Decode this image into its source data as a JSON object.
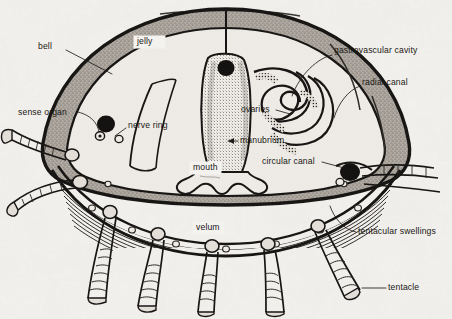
{
  "diagram": {
    "background_color": "#f4f2ee",
    "ink_color": "#15130f",
    "jelly_fill": "#a9a39b",
    "labels": [
      {
        "id": "bell",
        "text": "bell",
        "x": 38,
        "y": 47,
        "anchor": "start",
        "boxed": false
      },
      {
        "id": "jelly",
        "text": "jelly",
        "x": 137,
        "y": 42,
        "anchor": "start",
        "boxed": true
      },
      {
        "id": "gastrovascular-cavity",
        "text": "gastrovascular cavity",
        "x": 334,
        "y": 51,
        "anchor": "start",
        "boxed": false
      },
      {
        "id": "radial-canal",
        "text": "radial canal",
        "x": 362,
        "y": 83,
        "anchor": "start",
        "boxed": false
      },
      {
        "id": "sense-organ",
        "text": "sense organ",
        "x": 18,
        "y": 113,
        "anchor": "start",
        "boxed": false
      },
      {
        "id": "nerve-ring",
        "text": "nerve ring",
        "x": 128,
        "y": 126,
        "anchor": "start",
        "boxed": false
      },
      {
        "id": "ovaries",
        "text": "ovaries",
        "x": 241,
        "y": 110,
        "anchor": "start",
        "boxed": false
      },
      {
        "id": "manubrium",
        "text": "manubrium",
        "x": 240,
        "y": 141,
        "anchor": "start",
        "boxed": false
      },
      {
        "id": "mouth",
        "text": "mouth",
        "x": 193,
        "y": 168,
        "anchor": "start",
        "boxed": true
      },
      {
        "id": "circular-canal",
        "text": "circular canal",
        "x": 262,
        "y": 162,
        "anchor": "start",
        "boxed": false
      },
      {
        "id": "velum",
        "text": "velum",
        "x": 196,
        "y": 228,
        "anchor": "start",
        "boxed": true
      },
      {
        "id": "tentacular-swellings",
        "text": "tentacular swellings",
        "x": 358,
        "y": 232,
        "anchor": "start",
        "boxed": false
      },
      {
        "id": "tentacle",
        "text": "tentacle",
        "x": 388,
        "y": 288,
        "anchor": "start",
        "boxed": false
      }
    ]
  }
}
